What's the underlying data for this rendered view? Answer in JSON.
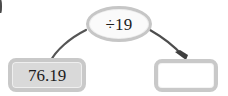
{
  "diagram": {
    "type": "function-machine-flow",
    "background_color": "#ffffff",
    "edge_marker": {
      "name": "clipped-list-marker",
      "color": "#4a4a4a"
    },
    "operator": {
      "label": "÷19",
      "symbol": "÷",
      "divisor": "19",
      "shape": "ellipse",
      "fill_color": "#fafafa",
      "border_color": "#c6c6c6"
    },
    "input": {
      "value": "76.19",
      "shape": "rounded-rectangle",
      "fill_color": "#d9d9d9",
      "border_color": "#c9c9c9"
    },
    "output": {
      "value": "",
      "placeholder": "",
      "shape": "rounded-rectangle",
      "fill_color": "#ffffff",
      "border_color": "#c9c9c9"
    },
    "arrows": [
      {
        "name": "input-to-operator-arrow",
        "from": "input",
        "to": "operator",
        "has_arrowhead": false,
        "color": "#555555"
      },
      {
        "name": "operator-to-output-arrow",
        "from": "operator",
        "to": "output",
        "has_arrowhead": true,
        "color": "#4d4d4d"
      }
    ]
  }
}
